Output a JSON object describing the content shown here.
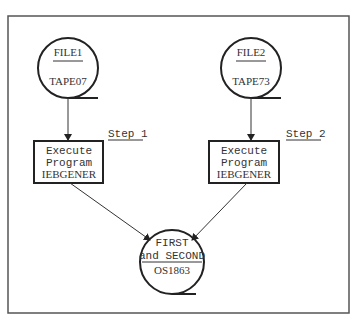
{
  "diagram": {
    "type": "flowchart",
    "colors": {
      "line": "#222222",
      "frame": "#555555",
      "text": "#333333",
      "background": "#ffffff"
    },
    "inputs": [
      {
        "id": "file1",
        "name": "FILE1",
        "volume": "TAPE07",
        "shape": "tape-reel"
      },
      {
        "id": "file2",
        "name": "FILE2",
        "volume": "TAPE73",
        "shape": "tape-reel"
      }
    ],
    "steps": [
      {
        "id": "step1",
        "label": "Step 1",
        "line1": "Execute",
        "line2": "Program",
        "line3": "IEBGENER"
      },
      {
        "id": "step2",
        "label": "Step 2",
        "line1": "Execute",
        "line2": "Program",
        "line3": "IEBGENER"
      }
    ],
    "output": {
      "id": "out",
      "line1": "FIRST",
      "line2": "and SECOND",
      "volume": "OS1863",
      "shape": "tape-reel"
    },
    "edges": [
      {
        "from": "file1",
        "to": "step1"
      },
      {
        "from": "file2",
        "to": "step2"
      },
      {
        "from": "step1",
        "to": "out"
      },
      {
        "from": "step2",
        "to": "out"
      }
    ]
  }
}
